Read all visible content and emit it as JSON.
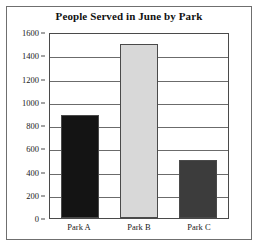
{
  "chart_data": {
    "type": "bar",
    "title": "People Served in June by Park",
    "categories": [
      "Park A",
      "Park B",
      "Park C"
    ],
    "values": [
      890,
      1500,
      500
    ],
    "xlabel": "",
    "ylabel": "",
    "ylim": [
      0,
      1600
    ],
    "yticks": [
      0,
      200,
      400,
      600,
      800,
      1000,
      1200,
      1400,
      1600
    ],
    "ytick_labels": [
      "0",
      "200",
      "400",
      "600",
      "800",
      "1000",
      "1200",
      "1400",
      "1600"
    ],
    "grid": true,
    "legend": false,
    "bar_colors": [
      "#141414",
      "#d8d8d8",
      "#3c3c3c"
    ],
    "series": [
      {
        "name": "People Served",
        "values": [
          890,
          1500,
          500
        ]
      }
    ]
  },
  "frame": {
    "border_color": "#6f6f6f"
  },
  "axes": {
    "axis_color": "#4a4a4a",
    "gridline_color": "#6b6b6b"
  }
}
